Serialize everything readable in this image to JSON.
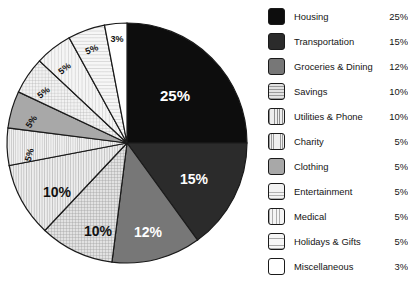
{
  "chart_data": {
    "type": "pie",
    "title": "",
    "legend_position": "right",
    "categories": [
      "Housing",
      "Transportation",
      "Groceries & Dining",
      "Savings",
      "Utilities & Phone",
      "Charity",
      "Clothing",
      "Entertainment",
      "Medical",
      "Holidays & Gifts",
      "Miscellaneous"
    ],
    "values": [
      25,
      15,
      12,
      10,
      10,
      5,
      5,
      5,
      5,
      5,
      3
    ],
    "value_labels": [
      "25%",
      "15%",
      "12%",
      "10%",
      "10%",
      "5%",
      "5%",
      "5%",
      "5%",
      "5%",
      "3%"
    ],
    "start_angle_deg": 0,
    "direction": "clockwise"
  },
  "legend": {
    "items": [
      {
        "label": "Housing",
        "value": "25%",
        "fill": "solid-black",
        "color": "#0d0d0d"
      },
      {
        "label": "Transportation",
        "value": "15%",
        "fill": "solid-darkgray",
        "color": "#2b2b2b"
      },
      {
        "label": "Groceries & Dining",
        "value": "12%",
        "fill": "solid-midgray",
        "color": "#777777"
      },
      {
        "label": "Savings",
        "value": "10%",
        "fill": "grid-hatch",
        "color": "#bfbfbf"
      },
      {
        "label": "Utilities & Phone",
        "value": "10%",
        "fill": "vertical-lines",
        "color": "#cccccc"
      },
      {
        "label": "Charity",
        "value": "5%",
        "fill": "vertical-lines-fine",
        "color": "#d4d4d4"
      },
      {
        "label": "Clothing",
        "value": "5%",
        "fill": "solid-lightgray",
        "color": "#a8a8a8"
      },
      {
        "label": "Entertainment",
        "value": "5%",
        "fill": "grid-hatch-light",
        "color": "#d8d8d8"
      },
      {
        "label": "Medical",
        "value": "5%",
        "fill": "vertical-lines-wide",
        "color": "#e0e0e0"
      },
      {
        "label": "Holidays & Gifts",
        "value": "5%",
        "fill": "horizontal-lines",
        "color": "#e4e4e4"
      },
      {
        "label": "Miscellaneous",
        "value": "3%",
        "fill": "white",
        "color": "#ffffff"
      }
    ]
  },
  "pie": {
    "center_x": 127,
    "center_y": 143,
    "radius": 120,
    "slices": [
      {
        "name": "Housing",
        "percent": 25,
        "label": "25%",
        "label_color": "#ffffff",
        "label_size": 15,
        "lx": 175,
        "ly": 97
      },
      {
        "name": "Transportation",
        "percent": 15,
        "label": "15%",
        "label_color": "#ffffff",
        "label_size": 14,
        "lx": 194,
        "ly": 180
      },
      {
        "name": "Groceries & Dining",
        "percent": 12,
        "label": "12%",
        "label_color": "#ffffff",
        "label_size": 14,
        "lx": 148,
        "ly": 233
      },
      {
        "name": "Savings",
        "percent": 10,
        "label": "10%",
        "label_color": "#111111",
        "label_size": 14,
        "lx": 98,
        "ly": 232
      },
      {
        "name": "Utilities & Phone",
        "percent": 10,
        "label": "10%",
        "label_color": "#111111",
        "label_size": 14,
        "lx": 57,
        "ly": 193
      },
      {
        "name": "Charity",
        "percent": 5,
        "label": "5%",
        "label_color": "#111111",
        "label_size": 9,
        "lx": 30,
        "ly": 155,
        "rot": -74
      },
      {
        "name": "Clothing",
        "percent": 5,
        "label": "5%",
        "label_color": "#111111",
        "label_size": 9,
        "lx": 32,
        "ly": 122,
        "rot": -56
      },
      {
        "name": "Entertainment",
        "percent": 5,
        "label": "5%",
        "label_color": "#111111",
        "label_size": 9,
        "lx": 44,
        "ly": 93,
        "rot": -38
      },
      {
        "name": "Medical",
        "percent": 5,
        "label": "5%",
        "label_color": "#111111",
        "label_size": 9,
        "lx": 65,
        "ly": 69,
        "rot": -38
      },
      {
        "name": "Holidays & Gifts",
        "percent": 5,
        "label": "5%",
        "label_color": "#111111",
        "label_size": 9,
        "lx": 92,
        "ly": 50,
        "rot": -22
      },
      {
        "name": "Miscellaneous",
        "percent": 3,
        "label": "3%",
        "label_color": "#111111",
        "label_size": 9,
        "lx": 117,
        "ly": 40,
        "rot": 0
      }
    ]
  },
  "caption": {
    "text": ""
  }
}
